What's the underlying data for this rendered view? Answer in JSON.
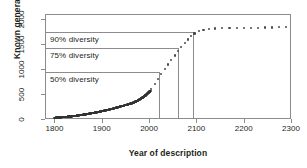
{
  "chart_data": {
    "type": "line",
    "title": "",
    "xlabel": "Year of description",
    "ylabel": "Known genera",
    "xlim": [
      1780,
      2300
    ],
    "ylim": [
      0,
      2100
    ],
    "xticks": [
      1800,
      1900,
      2000,
      2100,
      2200,
      2300
    ],
    "yticks": [
      0,
      500,
      1000,
      1500,
      2000
    ],
    "grid": false,
    "legend": null,
    "annotations": [
      {
        "label": "50% diversity",
        "y_value": 950,
        "x_value": 2020
      },
      {
        "label": "75% diversity",
        "y_value": 1430,
        "x_value": 2062
      },
      {
        "label": "90% diversity",
        "y_value": 1750,
        "x_value": 2092
      }
    ],
    "series": [
      {
        "name": "Observed (described genera)",
        "style": "solid-dots",
        "x": [
          1800,
          1810,
          1820,
          1830,
          1840,
          1850,
          1860,
          1870,
          1880,
          1890,
          1900,
          1910,
          1920,
          1930,
          1940,
          1950,
          1960,
          1965,
          1970,
          1975,
          1980,
          1985,
          1990,
          1995,
          2000,
          2003
        ],
        "y": [
          25,
          30,
          38,
          48,
          58,
          70,
          85,
          100,
          118,
          135,
          155,
          175,
          198,
          225,
          250,
          278,
          305,
          320,
          340,
          362,
          390,
          420,
          455,
          495,
          540,
          560
        ]
      },
      {
        "name": "Projected (logistic extrapolation)",
        "style": "dotted",
        "x": [
          2005,
          2012,
          2019,
          2026,
          2033,
          2040,
          2047,
          2054,
          2061,
          2068,
          2075,
          2082,
          2089,
          2096,
          2105,
          2115,
          2127,
          2140,
          2155,
          2170,
          2185,
          2200,
          2215,
          2230,
          2245,
          2260,
          2275,
          2290
        ],
        "y": [
          600,
          700,
          800,
          900,
          1000,
          1090,
          1180,
          1270,
          1355,
          1440,
          1520,
          1590,
          1655,
          1710,
          1755,
          1785,
          1800,
          1810,
          1818,
          1822,
          1825,
          1827,
          1828,
          1829,
          1830,
          1830,
          1831,
          1831
        ]
      }
    ]
  },
  "axis": {
    "y_title": "Known genera",
    "x_title": "Year of description",
    "y_tick_labels": [
      "0",
      "500",
      "1000",
      "1500",
      "2000"
    ],
    "x_tick_labels": [
      "1800",
      "1900",
      "2000",
      "2100",
      "2200",
      "2300"
    ]
  },
  "annotations": {
    "d50": "50% diversity",
    "d75": "75% diversity",
    "d90": "90% diversity"
  },
  "colors": {
    "frame": "#8c8c8c",
    "text": "#231f20",
    "data_solid": "#333333",
    "data_projected": "#4a4a4a",
    "background": "#ffffff"
  }
}
